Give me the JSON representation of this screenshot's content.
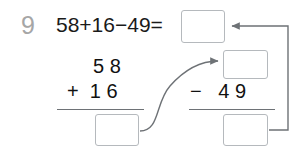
{
  "worksheet": {
    "problem_number": "9",
    "equation": "58+16−49=",
    "colors": {
      "problem_number": "#a6a6a6",
      "text": "#1a1a1a",
      "box_border": "#b5b9bd",
      "rule": "#6e7276",
      "arrow": "#6e7276"
    }
  },
  "addition": {
    "addend_top": "5 8",
    "operator_and_addend": "+  1 6",
    "sum_value": "",
    "sum_placeholder": ""
  },
  "subtraction": {
    "minuend_value": "",
    "minuend_placeholder": "",
    "operator_and_subtrahend": "−   4 9",
    "result_value": "",
    "result_placeholder": ""
  },
  "total": {
    "value": "",
    "placeholder": ""
  },
  "connectors": [
    {
      "name": "sum-to-minuend-arrow",
      "from": "addition-sum-box",
      "to": "subtraction-minuend-box"
    },
    {
      "name": "result-to-total-arrow",
      "from": "subtraction-result-box",
      "to": "total-box"
    }
  ]
}
